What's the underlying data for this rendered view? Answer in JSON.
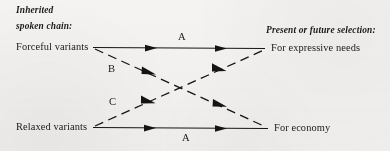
{
  "figure": {
    "type": "diagram",
    "background_color": "#f4f3f1",
    "ink_color": "#141414"
  },
  "headers": {
    "left_line1": "Inherited",
    "left_line2": "spoken chain:",
    "right": "Present or future selection:"
  },
  "nodes": [
    {
      "id": "forceful",
      "label": "Forceful variants",
      "side": "left",
      "x": 93,
      "y": 47
    },
    {
      "id": "expressive",
      "label": "For expressive needs",
      "side": "right",
      "x": 265,
      "y": 48
    },
    {
      "id": "relaxed",
      "label": "Relaxed variants",
      "side": "left",
      "x": 93,
      "y": 127
    },
    {
      "id": "economy",
      "label": "For economy",
      "side": "right",
      "x": 268,
      "y": 128
    }
  ],
  "edges": [
    {
      "id": "edge-a-top",
      "label": "A",
      "from": "forceful",
      "to": "expressive",
      "style": "solid",
      "label_x": 182,
      "label_y": 38
    },
    {
      "id": "edge-b",
      "label": "B",
      "from": "forceful",
      "to": "economy",
      "style": "dashed",
      "label_x": 112,
      "label_y": 70
    },
    {
      "id": "edge-c",
      "label": "C",
      "from": "relaxed",
      "to": "expressive",
      "style": "dashed",
      "label_x": 113,
      "label_y": 103
    },
    {
      "id": "edge-a-bottom",
      "label": "A",
      "from": "relaxed",
      "to": "economy",
      "style": "solid",
      "label_x": 186,
      "label_y": 139
    }
  ]
}
